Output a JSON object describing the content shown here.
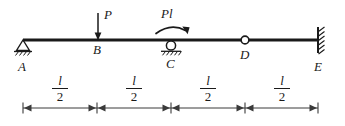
{
  "figure": {
    "stroke_color": "#1a1a1a",
    "background": "#ffffff"
  },
  "beam": {
    "left_x": 23,
    "right_x": 318,
    "y": 40,
    "thickness": 2.6
  },
  "nodes": [
    {
      "id": "A",
      "label": "A",
      "x": 23,
      "label_x": 18,
      "label_y": 60,
      "support": "pin"
    },
    {
      "id": "B",
      "label": "B",
      "x": 98,
      "label_x": 93,
      "label_y": 46,
      "support": "none"
    },
    {
      "id": "C",
      "label": "C",
      "x": 171,
      "label_x": 166,
      "label_y": 57,
      "support": "roller"
    },
    {
      "id": "D",
      "label": "D",
      "x": 245,
      "label_x": 240,
      "label_y": 50,
      "support": "none",
      "marker": "internal-hinge"
    },
    {
      "id": "E",
      "label": "E",
      "x": 318,
      "label_x": 314,
      "label_y": 60,
      "support": "fixed"
    }
  ],
  "loads": [
    {
      "type": "point-force",
      "label": "P",
      "label_x": 104,
      "label_y": 10,
      "at_x": 98,
      "from_y": 12,
      "to_y": 40,
      "direction": "down"
    },
    {
      "type": "moment",
      "label": "Pl",
      "label_x": 162,
      "label_y": 9,
      "at_x": 171,
      "arc_y": 32,
      "sense": "clockwise"
    }
  ],
  "dimensions": {
    "line_y": 108,
    "left_x": 23,
    "right_x": 318,
    "dividers": [
      97,
      171,
      245
    ],
    "segments": [
      {
        "numerator": "l",
        "denominator": "2",
        "center_x": 60,
        "label_y": 76
      },
      {
        "numerator": "l",
        "denominator": "2",
        "center_x": 134,
        "label_y": 76
      },
      {
        "numerator": "l",
        "denominator": "2",
        "center_x": 208,
        "label_y": 76
      },
      {
        "numerator": "l",
        "denominator": "2",
        "center_x": 282,
        "label_y": 76
      }
    ]
  }
}
